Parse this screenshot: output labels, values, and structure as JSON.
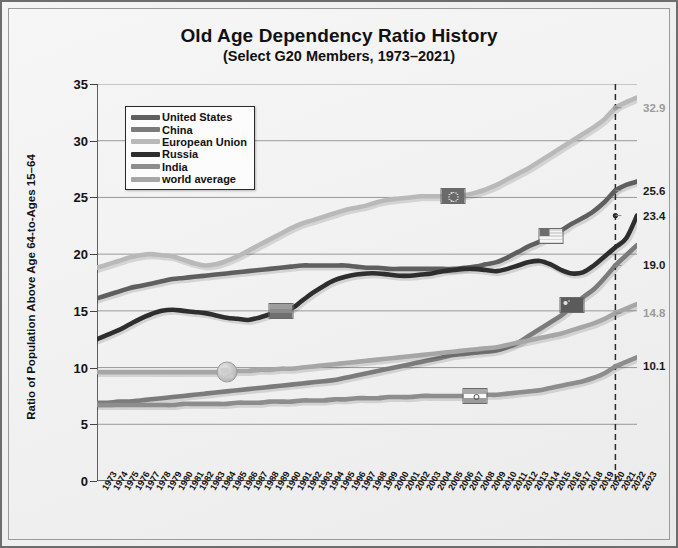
{
  "chart": {
    "title": "Old Age Dependency Ratio History",
    "subtitle": "(Select G20 Members, 1973–2021)",
    "ylabel": "Ratio of Population Above  Age 64-to-Ages 15–64"
  },
  "chart_data": {
    "type": "line",
    "title": "Old Age Dependency Ratio History",
    "subtitle": "(Select G20 Members, 1973–2021)",
    "xlabel": "",
    "ylabel": "Ratio of Population Above  Age 64-to-Ages 15–64",
    "ylim": [
      0,
      35
    ],
    "yticks": [
      0,
      5,
      10,
      15,
      20,
      25,
      30,
      35
    ],
    "xlim": [
      1973,
      2023
    ],
    "grid": "horizontal",
    "legend_position": "upper-left",
    "reference_line": {
      "x": 2021,
      "style": "dashed",
      "color": "#2b2b2b"
    },
    "x": [
      1973,
      1974,
      1975,
      1976,
      1977,
      1978,
      1979,
      1980,
      1981,
      1982,
      1983,
      1984,
      1985,
      1986,
      1987,
      1988,
      1989,
      1990,
      1991,
      1992,
      1993,
      1994,
      1995,
      1996,
      1997,
      1998,
      1999,
      2000,
      2001,
      2002,
      2003,
      2004,
      2005,
      2006,
      2007,
      2008,
      2009,
      2010,
      2011,
      2012,
      2013,
      2014,
      2015,
      2016,
      2017,
      2018,
      2019,
      2020,
      2021,
      2022,
      2023
    ],
    "xticklabels": [
      "1973",
      "1974",
      "1975",
      "1976",
      "1977",
      "1978",
      "1979",
      "1980",
      "1981",
      "1982",
      "1983",
      "1984",
      "1985",
      "1986",
      "1987",
      "1988",
      "1989",
      "1990",
      "1991",
      "1992",
      "1993",
      "1994",
      "1995",
      "1996",
      "1997",
      "1998",
      "1999",
      "2000",
      "2001",
      "2002",
      "2003",
      "2004",
      "2005",
      "2006",
      "2007",
      "2008",
      "2009",
      "2010",
      "2011",
      "2012",
      "2013",
      "2014",
      "2015",
      "2016",
      "2017",
      "2018",
      "2019",
      "2020",
      "2021",
      "2022",
      "2023"
    ],
    "series": [
      {
        "name": "European Union",
        "color": "#b9b9b9",
        "end_value": 32.9,
        "end_label": "32.9",
        "marker": {
          "kind": "flag-eu",
          "year": 2006,
          "value": 25.1
        },
        "values": [
          18.8,
          19.1,
          19.4,
          19.7,
          19.9,
          20.0,
          19.9,
          19.8,
          19.5,
          19.2,
          19.0,
          19.1,
          19.4,
          19.8,
          20.3,
          20.8,
          21.3,
          21.8,
          22.3,
          22.7,
          23.0,
          23.3,
          23.6,
          23.9,
          24.1,
          24.3,
          24.6,
          24.8,
          24.9,
          25.0,
          25.1,
          25.1,
          25.1,
          25.1,
          25.2,
          25.4,
          25.7,
          26.1,
          26.6,
          27.1,
          27.6,
          28.2,
          28.8,
          29.4,
          30.0,
          30.6,
          31.2,
          31.9,
          32.9,
          33.4,
          33.8
        ]
      },
      {
        "name": "United States",
        "color": "#5f5f5f",
        "end_value": 25.6,
        "end_label": "25.6",
        "marker": {
          "kind": "flag-us",
          "year": 2015,
          "value": 21.6
        },
        "values": [
          16.1,
          16.4,
          16.7,
          17.0,
          17.2,
          17.4,
          17.6,
          17.8,
          17.9,
          18.0,
          18.1,
          18.2,
          18.3,
          18.4,
          18.5,
          18.6,
          18.7,
          18.8,
          18.9,
          19.0,
          19.0,
          19.0,
          19.0,
          19.0,
          18.9,
          18.8,
          18.8,
          18.7,
          18.7,
          18.7,
          18.7,
          18.7,
          18.7,
          18.7,
          18.8,
          18.9,
          19.1,
          19.3,
          19.7,
          20.2,
          20.7,
          21.1,
          21.6,
          22.1,
          22.7,
          23.2,
          23.8,
          24.6,
          25.6,
          26.1,
          26.4
        ]
      },
      {
        "name": "Russia",
        "color": "#2e2e2e",
        "end_value": 23.4,
        "end_label": "23.4",
        "marker": {
          "kind": "flag-ru",
          "year": 1990,
          "value": 15.0
        },
        "values": [
          12.5,
          12.9,
          13.3,
          13.8,
          14.3,
          14.7,
          15.0,
          15.1,
          15.0,
          14.9,
          14.8,
          14.6,
          14.4,
          14.3,
          14.2,
          14.4,
          14.7,
          15.0,
          15.2,
          15.9,
          16.6,
          17.2,
          17.7,
          18.0,
          18.2,
          18.3,
          18.3,
          18.2,
          18.1,
          18.1,
          18.2,
          18.3,
          18.5,
          18.6,
          18.7,
          18.7,
          18.6,
          18.5,
          18.7,
          19.0,
          19.3,
          19.4,
          19.1,
          18.6,
          18.3,
          18.4,
          19.0,
          19.8,
          20.6,
          21.4,
          23.4
        ]
      },
      {
        "name": "China",
        "color": "#7b7b7b",
        "end_value": 19.0,
        "end_label": "19.0",
        "marker": {
          "kind": "flag-cn",
          "year": 2017,
          "value": 15.5
        },
        "values": [
          6.9,
          6.9,
          7.0,
          7.0,
          7.1,
          7.2,
          7.3,
          7.4,
          7.5,
          7.6,
          7.7,
          7.8,
          7.9,
          8.0,
          8.1,
          8.2,
          8.3,
          8.4,
          8.5,
          8.6,
          8.7,
          8.8,
          8.9,
          9.1,
          9.3,
          9.5,
          9.7,
          9.9,
          10.1,
          10.3,
          10.5,
          10.7,
          10.9,
          11.1,
          11.2,
          11.3,
          11.4,
          11.5,
          11.8,
          12.2,
          12.8,
          13.4,
          14.0,
          14.6,
          15.4,
          16.2,
          16.9,
          17.9,
          19.0,
          19.9,
          20.8
        ]
      },
      {
        "name": "world average",
        "color": "#a6a6a6",
        "end_value": 14.8,
        "end_label": "14.8",
        "marker": {
          "kind": "globe",
          "year": 1985,
          "value": 9.6
        },
        "values": [
          9.6,
          9.6,
          9.6,
          9.6,
          9.6,
          9.6,
          9.6,
          9.6,
          9.6,
          9.6,
          9.6,
          9.6,
          9.6,
          9.7,
          9.7,
          9.8,
          9.8,
          9.9,
          9.9,
          10.0,
          10.1,
          10.2,
          10.3,
          10.4,
          10.5,
          10.6,
          10.7,
          10.8,
          10.9,
          11.0,
          11.1,
          11.2,
          11.3,
          11.4,
          11.5,
          11.6,
          11.7,
          11.8,
          12.0,
          12.2,
          12.4,
          12.6,
          12.8,
          13.0,
          13.3,
          13.6,
          13.9,
          14.3,
          14.8,
          15.2,
          15.6
        ]
      },
      {
        "name": "India",
        "color": "#8d8d8d",
        "end_value": 10.1,
        "end_label": "10.1",
        "marker": {
          "kind": "flag-in",
          "year": 2008,
          "value": 7.5
        },
        "values": [
          6.7,
          6.7,
          6.7,
          6.7,
          6.7,
          6.7,
          6.7,
          6.7,
          6.8,
          6.8,
          6.8,
          6.8,
          6.8,
          6.9,
          6.9,
          6.9,
          7.0,
          7.0,
          7.0,
          7.1,
          7.1,
          7.1,
          7.2,
          7.2,
          7.3,
          7.3,
          7.3,
          7.4,
          7.4,
          7.4,
          7.5,
          7.5,
          7.5,
          7.5,
          7.5,
          7.5,
          7.6,
          7.6,
          7.7,
          7.8,
          7.9,
          8.0,
          8.2,
          8.4,
          8.6,
          8.8,
          9.1,
          9.5,
          10.1,
          10.5,
          10.9
        ]
      }
    ]
  },
  "legend": {
    "items": [
      {
        "label": "United States",
        "color": "#5f5f5f"
      },
      {
        "label": "China",
        "color": "#7b7b7b"
      },
      {
        "label": "European Union",
        "color": "#b9b9b9"
      },
      {
        "label": "Russia",
        "color": "#2e2e2e"
      },
      {
        "label": "India",
        "color": "#8d8d8d"
      },
      {
        "label": "world average",
        "color": "#a6a6a6"
      }
    ]
  }
}
